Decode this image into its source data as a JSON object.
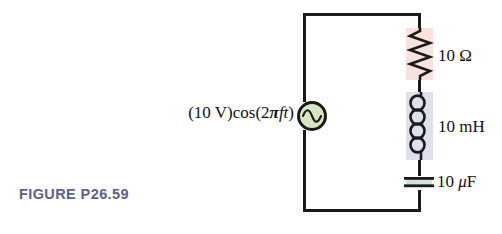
{
  "figure": {
    "caption": "FIGURE P26.59",
    "caption_color": "#5d5f90",
    "background_color": "#ffffff",
    "wire_color": "#1a1a1a"
  },
  "circuit": {
    "type": "series RLC circuit driven by an AC voltage source",
    "source": {
      "name": "ac-voltage-source",
      "symbol": "sine-wave-in-circle",
      "amplitude_text": "(10 V)",
      "cos_text": "cos",
      "argument_open": "(2",
      "argument_pi": "π",
      "argument_ft": "ft",
      "argument_close": ")",
      "full_label": "(10 V)cos(2πft)",
      "fill_color": "#d9e6c4"
    },
    "components": [
      {
        "name": "resistor",
        "symbol": "zigzag",
        "value": "10",
        "unit": "Ω",
        "label": "10 Ω",
        "highlight_color": "#f7e3dc"
      },
      {
        "name": "inductor",
        "symbol": "coil",
        "coils": 4,
        "value": "10",
        "unit": "mH",
        "label": "10 mH",
        "highlight_color": "#dfe0ee"
      },
      {
        "name": "capacitor",
        "symbol": "parallel-plates",
        "value": "10",
        "unit": "μF",
        "label_number": "10 ",
        "label_mu": "μ",
        "label_unit": "F",
        "label": "10 μF",
        "highlight_color": "#cfe4dd"
      }
    ]
  }
}
